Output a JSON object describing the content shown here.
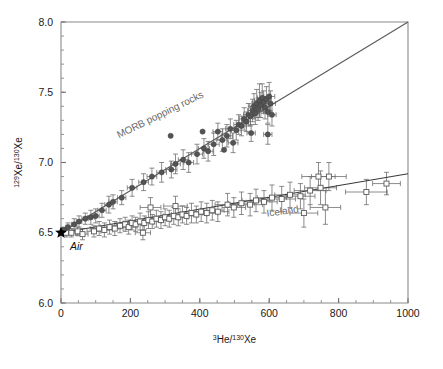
{
  "chart_data": {
    "type": "scatter",
    "title": "",
    "xlabel": "3He/130Xe",
    "xlabel_pre_sup": "3",
    "xlabel_mid": "He/",
    "xlabel_sup2": "130",
    "xlabel_end": "Xe",
    "ylabel": "129Xe/130Xe",
    "ylabel_sup1": "129",
    "ylabel_mid": "Xe/",
    "ylabel_sup2": "130",
    "ylabel_end": "Xe",
    "xlim": [
      0,
      1000
    ],
    "ylim": [
      6.0,
      8.0
    ],
    "xticks": [
      0,
      200,
      400,
      600,
      800,
      1000
    ],
    "xtick_labels": [
      "0",
      "200",
      "400",
      "600",
      "800",
      "1000"
    ],
    "yticks": [
      6.0,
      6.5,
      7.0,
      7.5,
      8.0
    ],
    "ytick_labels": [
      "6.0",
      "6.5",
      "7.0",
      "7.5",
      "8.0"
    ],
    "x_minor_step": 50,
    "y_minor_step": 0.1,
    "grid": false,
    "legend_position": "inline-annotation",
    "annotations": [
      {
        "name": "air",
        "text": "Air",
        "x": 0,
        "y": 6.5,
        "style": "italic",
        "marker": "star"
      },
      {
        "name": "morb",
        "text": "MORB popping rocks",
        "x": 290,
        "y": 7.32,
        "rotation": -26,
        "color": "#6b6b6b"
      },
      {
        "name": "iceland",
        "text": "Iceland",
        "x": 640,
        "y": 6.63,
        "rotation": -8,
        "color": "#6b6b6b"
      }
    ],
    "series": [
      {
        "name": "MORB popping rocks",
        "marker": "filled-circle",
        "color": "#545454",
        "trendline": {
          "x0": 0,
          "y0": 6.5,
          "x1": 1000,
          "y1": 8.0
        },
        "points": [
          {
            "x": 8,
            "y": 6.52,
            "xerr": 4,
            "yerr": 0.02
          },
          {
            "x": 20,
            "y": 6.54,
            "xerr": 6,
            "yerr": 0.03
          },
          {
            "x": 38,
            "y": 6.56,
            "xerr": 8,
            "yerr": 0.04
          },
          {
            "x": 52,
            "y": 6.58,
            "xerr": 8,
            "yerr": 0.04
          },
          {
            "x": 70,
            "y": 6.6,
            "xerr": 10,
            "yerr": 0.04
          },
          {
            "x": 86,
            "y": 6.61,
            "xerr": 10,
            "yerr": 0.05
          },
          {
            "x": 100,
            "y": 6.62,
            "xerr": 10,
            "yerr": 0.05
          },
          {
            "x": 118,
            "y": 6.66,
            "xerr": 12,
            "yerr": 0.05
          },
          {
            "x": 138,
            "y": 6.7,
            "xerr": 12,
            "yerr": 0.06
          },
          {
            "x": 150,
            "y": 6.72,
            "xerr": 12,
            "yerr": 0.05
          },
          {
            "x": 175,
            "y": 6.75,
            "xerr": 12,
            "yerr": 0.05
          },
          {
            "x": 205,
            "y": 6.82,
            "xerr": 14,
            "yerr": 0.06
          },
          {
            "x": 238,
            "y": 6.86,
            "xerr": 14,
            "yerr": 0.06
          },
          {
            "x": 262,
            "y": 6.9,
            "xerr": 14,
            "yerr": 0.06
          },
          {
            "x": 290,
            "y": 6.93,
            "xerr": 14,
            "yerr": 0.07
          },
          {
            "x": 318,
            "y": 6.95,
            "xerr": 16,
            "yerr": 0.06
          },
          {
            "x": 330,
            "y": 6.99,
            "xerr": 14,
            "yerr": 0.07
          },
          {
            "x": 352,
            "y": 7.02,
            "xerr": 14,
            "yerr": 0.07
          },
          {
            "x": 368,
            "y": 7.0,
            "xerr": 14,
            "yerr": 0.07
          },
          {
            "x": 392,
            "y": 7.06,
            "xerr": 16,
            "yerr": 0.07
          },
          {
            "x": 412,
            "y": 7.1,
            "xerr": 16,
            "yerr": 0.07
          },
          {
            "x": 424,
            "y": 7.08,
            "xerr": 14,
            "yerr": 0.07
          },
          {
            "x": 440,
            "y": 7.13,
            "xerr": 16,
            "yerr": 0.08
          },
          {
            "x": 452,
            "y": 7.22,
            "xerr": 14,
            "yerr": 0.06
          },
          {
            "x": 465,
            "y": 7.16,
            "xerr": 16,
            "yerr": 0.08
          },
          {
            "x": 478,
            "y": 7.19,
            "xerr": 16,
            "yerr": 0.08
          },
          {
            "x": 488,
            "y": 7.24,
            "xerr": 14,
            "yerr": 0.07
          },
          {
            "x": 496,
            "y": 7.14,
            "xerr": 14,
            "yerr": 0.07
          },
          {
            "x": 505,
            "y": 7.23,
            "xerr": 14,
            "yerr": 0.07
          },
          {
            "x": 512,
            "y": 7.27,
            "xerr": 14,
            "yerr": 0.07
          },
          {
            "x": 520,
            "y": 7.26,
            "xerr": 14,
            "yerr": 0.07
          },
          {
            "x": 528,
            "y": 7.31,
            "xerr": 14,
            "yerr": 0.08
          },
          {
            "x": 534,
            "y": 7.29,
            "xerr": 12,
            "yerr": 0.07
          },
          {
            "x": 540,
            "y": 7.34,
            "xerr": 14,
            "yerr": 0.08
          },
          {
            "x": 546,
            "y": 7.33,
            "xerr": 12,
            "yerr": 0.07
          },
          {
            "x": 552,
            "y": 7.37,
            "xerr": 14,
            "yerr": 0.08
          },
          {
            "x": 556,
            "y": 7.4,
            "xerr": 12,
            "yerr": 0.09
          },
          {
            "x": 560,
            "y": 7.35,
            "xerr": 12,
            "yerr": 0.08
          },
          {
            "x": 564,
            "y": 7.42,
            "xerr": 14,
            "yerr": 0.1
          },
          {
            "x": 568,
            "y": 7.38,
            "xerr": 12,
            "yerr": 0.08
          },
          {
            "x": 572,
            "y": 7.44,
            "xerr": 14,
            "yerr": 0.12
          },
          {
            "x": 576,
            "y": 7.41,
            "xerr": 12,
            "yerr": 0.09
          },
          {
            "x": 580,
            "y": 7.46,
            "xerr": 14,
            "yerr": 0.1
          },
          {
            "x": 584,
            "y": 7.43,
            "xerr": 12,
            "yerr": 0.08
          },
          {
            "x": 588,
            "y": 7.39,
            "xerr": 12,
            "yerr": 0.08
          },
          {
            "x": 592,
            "y": 7.45,
            "xerr": 14,
            "yerr": 0.09
          },
          {
            "x": 596,
            "y": 7.36,
            "xerr": 12,
            "yerr": 0.08
          },
          {
            "x": 600,
            "y": 7.47,
            "xerr": 16,
            "yerr": 0.1
          },
          {
            "x": 604,
            "y": 7.42,
            "xerr": 14,
            "yerr": 0.09
          },
          {
            "x": 608,
            "y": 7.34,
            "xerr": 12,
            "yerr": 0.08
          },
          {
            "x": 548,
            "y": 7.21,
            "xerr": 12,
            "yerr": 0.06
          },
          {
            "x": 596,
            "y": 7.2,
            "xerr": 12,
            "yerr": 0.07
          },
          {
            "x": 408,
            "y": 7.22,
            "xerr": 0,
            "yerr": 0.0
          },
          {
            "x": 470,
            "y": 7.09,
            "xerr": 0,
            "yerr": 0.0
          },
          {
            "x": 316,
            "y": 7.19,
            "xerr": 0,
            "yerr": 0.0
          }
        ]
      },
      {
        "name": "Iceland",
        "marker": "open-square",
        "color": "#5a5a5a",
        "trendline": {
          "x0": 0,
          "y0": 6.5,
          "x1": 1000,
          "y1": 6.92
        },
        "points": [
          {
            "x": 15,
            "y": 6.5,
            "xerr": 10,
            "yerr": 0.03
          },
          {
            "x": 30,
            "y": 6.5,
            "xerr": 12,
            "yerr": 0.03
          },
          {
            "x": 48,
            "y": 6.51,
            "xerr": 14,
            "yerr": 0.03
          },
          {
            "x": 110,
            "y": 6.53,
            "xerr": 26,
            "yerr": 0.05
          },
          {
            "x": 125,
            "y": 6.52,
            "xerr": 24,
            "yerr": 0.05
          },
          {
            "x": 140,
            "y": 6.54,
            "xerr": 26,
            "yerr": 0.05
          },
          {
            "x": 155,
            "y": 6.53,
            "xerr": 24,
            "yerr": 0.05
          },
          {
            "x": 170,
            "y": 6.55,
            "xerr": 28,
            "yerr": 0.05
          },
          {
            "x": 185,
            "y": 6.56,
            "xerr": 26,
            "yerr": 0.05
          },
          {
            "x": 195,
            "y": 6.54,
            "xerr": 24,
            "yerr": 0.05
          },
          {
            "x": 205,
            "y": 6.57,
            "xerr": 26,
            "yerr": 0.05
          },
          {
            "x": 215,
            "y": 6.56,
            "xerr": 24,
            "yerr": 0.05
          },
          {
            "x": 228,
            "y": 6.58,
            "xerr": 28,
            "yerr": 0.06
          },
          {
            "x": 240,
            "y": 6.57,
            "xerr": 26,
            "yerr": 0.05
          },
          {
            "x": 252,
            "y": 6.59,
            "xerr": 28,
            "yerr": 0.06
          },
          {
            "x": 263,
            "y": 6.58,
            "xerr": 26,
            "yerr": 0.05
          },
          {
            "x": 275,
            "y": 6.6,
            "xerr": 30,
            "yerr": 0.06
          },
          {
            "x": 288,
            "y": 6.59,
            "xerr": 28,
            "yerr": 0.06
          },
          {
            "x": 300,
            "y": 6.61,
            "xerr": 30,
            "yerr": 0.06
          },
          {
            "x": 312,
            "y": 6.6,
            "xerr": 28,
            "yerr": 0.06
          },
          {
            "x": 325,
            "y": 6.62,
            "xerr": 30,
            "yerr": 0.06
          },
          {
            "x": 338,
            "y": 6.61,
            "xerr": 28,
            "yerr": 0.06
          },
          {
            "x": 350,
            "y": 6.63,
            "xerr": 32,
            "yerr": 0.06
          },
          {
            "x": 362,
            "y": 6.62,
            "xerr": 30,
            "yerr": 0.06
          },
          {
            "x": 376,
            "y": 6.64,
            "xerr": 32,
            "yerr": 0.07
          },
          {
            "x": 390,
            "y": 6.63,
            "xerr": 30,
            "yerr": 0.06
          },
          {
            "x": 404,
            "y": 6.65,
            "xerr": 34,
            "yerr": 0.07
          },
          {
            "x": 420,
            "y": 6.64,
            "xerr": 32,
            "yerr": 0.07
          },
          {
            "x": 436,
            "y": 6.66,
            "xerr": 34,
            "yerr": 0.07
          },
          {
            "x": 452,
            "y": 6.65,
            "xerr": 32,
            "yerr": 0.07
          },
          {
            "x": 330,
            "y": 6.69,
            "xerr": 34,
            "yerr": 0.07
          },
          {
            "x": 258,
            "y": 6.68,
            "xerr": 30,
            "yerr": 0.07
          },
          {
            "x": 480,
            "y": 6.7,
            "xerr": 36,
            "yerr": 0.08
          },
          {
            "x": 498,
            "y": 6.68,
            "xerr": 34,
            "yerr": 0.07
          },
          {
            "x": 520,
            "y": 6.71,
            "xerr": 38,
            "yerr": 0.08
          },
          {
            "x": 545,
            "y": 6.7,
            "xerr": 36,
            "yerr": 0.08
          },
          {
            "x": 562,
            "y": 6.73,
            "xerr": 40,
            "yerr": 0.08
          },
          {
            "x": 585,
            "y": 6.72,
            "xerr": 38,
            "yerr": 0.08
          },
          {
            "x": 608,
            "y": 6.75,
            "xerr": 42,
            "yerr": 0.09
          },
          {
            "x": 636,
            "y": 6.74,
            "xerr": 40,
            "yerr": 0.09
          },
          {
            "x": 660,
            "y": 6.77,
            "xerr": 44,
            "yerr": 0.09
          },
          {
            "x": 690,
            "y": 6.76,
            "xerr": 42,
            "yerr": 0.09
          },
          {
            "x": 718,
            "y": 6.8,
            "xerr": 46,
            "yerr": 0.1
          },
          {
            "x": 742,
            "y": 6.9,
            "xerr": 48,
            "yerr": 0.1
          },
          {
            "x": 772,
            "y": 6.9,
            "xerr": 50,
            "yerr": 0.1
          },
          {
            "x": 748,
            "y": 6.82,
            "xerr": 46,
            "yerr": 0.12
          },
          {
            "x": 762,
            "y": 6.68,
            "xerr": 44,
            "yerr": 0.12
          },
          {
            "x": 700,
            "y": 6.64,
            "xerr": 40,
            "yerr": 0.1
          },
          {
            "x": 880,
            "y": 6.79,
            "xerr": 60,
            "yerr": 0.09
          },
          {
            "x": 938,
            "y": 6.85,
            "xerr": 40,
            "yerr": 0.08
          },
          {
            "x": 236,
            "y": 6.5,
            "xerr": 22,
            "yerr": 0.05
          },
          {
            "x": 62,
            "y": 6.49,
            "xerr": 16,
            "yerr": 0.04
          },
          {
            "x": 95,
            "y": 6.51,
            "xerr": 20,
            "yerr": 0.04
          }
        ]
      }
    ]
  }
}
